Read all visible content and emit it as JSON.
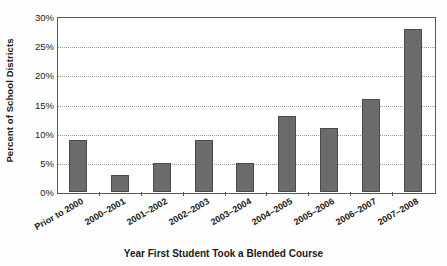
{
  "chart_data": {
    "type": "bar",
    "title": "",
    "xlabel": "Year First Student Took a Blended Course",
    "ylabel": "Percent of School Districts",
    "categories": [
      "Prior to 2000",
      "2000–2001",
      "2001–2002",
      "2002–2003",
      "2003–2004",
      "2004–2005",
      "2005–2006",
      "2006–2007",
      "2007–2008"
    ],
    "values": [
      9,
      3,
      5,
      9,
      5,
      13,
      11,
      16,
      28
    ],
    "ylim": [
      0,
      30
    ],
    "ytick_values": [
      0,
      5,
      10,
      15,
      20,
      25,
      30
    ],
    "ytick_labels": [
      "0%",
      "5%",
      "10%",
      "15%",
      "20%",
      "25%",
      "30%"
    ],
    "grid": true,
    "legend": null,
    "bar_color": "#6b6b6b",
    "bar_edge_color": "#4a4a4a",
    "gridline_color": "#9a9a9c",
    "axis_color": "#58585a",
    "background_color": "#ffffff"
  }
}
